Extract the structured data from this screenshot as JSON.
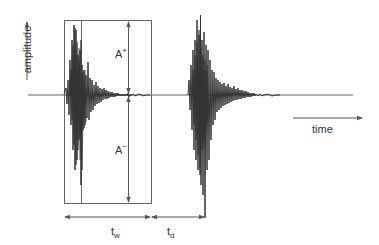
{
  "diagram": {
    "type": "signal-waveform-schematic",
    "axes": {
      "y_label": "amplitude",
      "x_label": "time"
    },
    "labels": {
      "a_plus": {
        "base": "A",
        "sup": "+"
      },
      "a_minus": {
        "base": "A",
        "sup": "−"
      },
      "t_w": {
        "base": "t",
        "sub": "w"
      },
      "t_d": {
        "base": "t",
        "sub": "d"
      }
    },
    "colors": {
      "line": "#555555",
      "signal": "#333333",
      "background": "#ffffff"
    },
    "elements": [
      "window-box around first burst",
      "vertical double arrow A+ / A- peak amplitudes",
      "horizontal double arrow t_w window duration",
      "horizontal double arrow t_d delay duration",
      "first decaying oscillation burst",
      "second decaying oscillation burst"
    ]
  }
}
